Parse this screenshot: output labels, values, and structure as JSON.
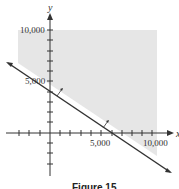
{
  "figure": {
    "caption": "Figure 15",
    "x_axis_label": "x",
    "y_axis_label": "y",
    "x_tick_labels": [
      "5,000",
      "10,000"
    ],
    "y_tick_labels": [
      "5,000",
      "10,000"
    ],
    "shade_color": "#e6e6e6",
    "line_color": "#333333",
    "boundary_line": {
      "y_intercept": 4000,
      "x_intercept": 6000
    },
    "shaded_region": "half-plane above the boundary line"
  }
}
